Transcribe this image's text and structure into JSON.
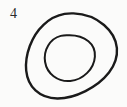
{
  "figure": {
    "label": "4",
    "label_position": "top-left",
    "caption": "",
    "background_color": "#fbfbfa",
    "ink_color": "#1a1a1a",
    "label_color": "#2b2b2b",
    "stroke_width": 2.2,
    "shapes": [
      {
        "name": "outer-blob",
        "kind": "closed-freehand-curve",
        "bounds": {
          "x": 26,
          "y": 13,
          "width": 91,
          "height": 86
        },
        "stroke_width": 2.4
      },
      {
        "name": "inner-blob",
        "kind": "closed-freehand-curve",
        "bounds": {
          "x": 45,
          "y": 35,
          "width": 50,
          "height": 46
        },
        "stroke_width": 2.0
      }
    ]
  }
}
